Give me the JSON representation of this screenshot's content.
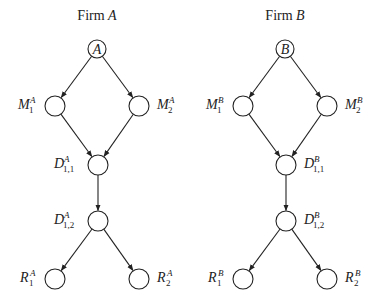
{
  "diagram": {
    "firms": [
      {
        "title_prefix": "Firm",
        "title_var": "A",
        "root_label": "A",
        "nodes": [
          {
            "id": "root",
            "label": "A"
          },
          {
            "id": "M1",
            "base": "M",
            "sup": "A",
            "sub": "1"
          },
          {
            "id": "M2",
            "base": "M",
            "sup": "A",
            "sub": "2"
          },
          {
            "id": "D11",
            "base": "D",
            "sup": "A",
            "sub": "1,1"
          },
          {
            "id": "D12",
            "base": "D",
            "sup": "A",
            "sub": "1,2"
          },
          {
            "id": "R1",
            "base": "R",
            "sup": "A",
            "sub": "1"
          },
          {
            "id": "R2",
            "base": "R",
            "sup": "A",
            "sub": "2"
          }
        ]
      },
      {
        "title_prefix": "Firm",
        "title_var": "B",
        "root_label": "B",
        "nodes": [
          {
            "id": "root",
            "label": "B"
          },
          {
            "id": "M1",
            "base": "M",
            "sup": "B",
            "sub": "1"
          },
          {
            "id": "M2",
            "base": "M",
            "sup": "B",
            "sub": "2"
          },
          {
            "id": "D11",
            "base": "D",
            "sup": "B",
            "sub": "1,1"
          },
          {
            "id": "D12",
            "base": "D",
            "sup": "B",
            "sub": "1,2"
          },
          {
            "id": "R1",
            "base": "R",
            "sup": "B",
            "sub": "1"
          },
          {
            "id": "R2",
            "base": "R",
            "sup": "B",
            "sub": "2"
          }
        ]
      }
    ],
    "edges": [
      [
        "root",
        "M1"
      ],
      [
        "root",
        "M2"
      ],
      [
        "M1",
        "D11"
      ],
      [
        "M2",
        "D11"
      ],
      [
        "D11",
        "D12"
      ],
      [
        "D12",
        "R1"
      ],
      [
        "D12",
        "R2"
      ]
    ]
  }
}
